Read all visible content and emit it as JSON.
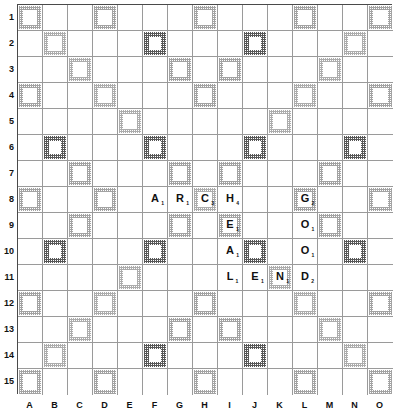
{
  "board": {
    "name": "Scrabble board",
    "size": 15,
    "col_labels": [
      "A",
      "B",
      "C",
      "D",
      "E",
      "F",
      "G",
      "H",
      "I",
      "J",
      "K",
      "L",
      "M",
      "N",
      "O"
    ],
    "row_labels": [
      "1",
      "2",
      "3",
      "4",
      "5",
      "6",
      "7",
      "8",
      "9",
      "10",
      "11",
      "12",
      "13",
      "14",
      "15"
    ],
    "legend": {
      "tw": "triple-word-square",
      "dw": "double-word-square",
      "tl": "triple-letter-square",
      "dl": "double-letter-square",
      "star": "center-star-square"
    },
    "colors": {
      "triple_word": "#8d8d8d",
      "double_word": "#a8a8a8",
      "triple_letter": "#4f4f4f",
      "double_letter": "#9e9e9e",
      "grid_line": "#9a9a9a",
      "border": "#4a4a4a",
      "background": "#ffffff",
      "text": "#111111"
    },
    "premium_squares": {
      "tw": [
        "A1",
        "H1",
        "O1",
        "A8",
        "O8",
        "A15",
        "H15",
        "O15"
      ],
      "dw": [
        "B2",
        "C3",
        "D4",
        "E5",
        "N2",
        "M3",
        "L4",
        "K5",
        "B14",
        "C13",
        "D12",
        "E11",
        "N14",
        "M13",
        "L12",
        "K11"
      ],
      "tl": [
        "F2",
        "J2",
        "B6",
        "F6",
        "J6",
        "N6",
        "B10",
        "F10",
        "J10",
        "N10",
        "F14",
        "J14"
      ],
      "dl": [
        "D1",
        "L1",
        "G3",
        "I3",
        "A4",
        "H4",
        "O4",
        "C7",
        "G7",
        "I7",
        "M7",
        "D8",
        "L8",
        "C9",
        "G9",
        "I9",
        "M9",
        "A12",
        "H12",
        "O12",
        "G13",
        "I13",
        "D15",
        "L15"
      ],
      "star": [
        "H8"
      ]
    },
    "tiles": [
      {
        "square": "F8",
        "letter": "A",
        "value": "1",
        "word_ids": [
          "arch"
        ]
      },
      {
        "square": "G8",
        "letter": "R",
        "value": "1",
        "word_ids": [
          "arch"
        ]
      },
      {
        "square": "H8",
        "letter": "C",
        "value": "3",
        "word_ids": [
          "arch"
        ]
      },
      {
        "square": "I8",
        "letter": "H",
        "value": "4",
        "word_ids": [
          "arch",
          "heal"
        ]
      },
      {
        "square": "I9",
        "letter": "E",
        "value": "1",
        "word_ids": [
          "heal"
        ]
      },
      {
        "square": "I10",
        "letter": "A",
        "value": "1",
        "word_ids": [
          "heal"
        ]
      },
      {
        "square": "I11",
        "letter": "L",
        "value": "1",
        "word_ids": [
          "heal",
          "lend"
        ]
      },
      {
        "square": "J11",
        "letter": "E",
        "value": "1",
        "word_ids": [
          "lend"
        ]
      },
      {
        "square": "K11",
        "letter": "N",
        "value": "1",
        "word_ids": [
          "lend"
        ]
      },
      {
        "square": "L11",
        "letter": "D",
        "value": "2",
        "word_ids": [
          "lend",
          "good"
        ]
      },
      {
        "square": "L10",
        "letter": "O",
        "value": "1",
        "word_ids": [
          "good"
        ]
      },
      {
        "square": "L9",
        "letter": "O",
        "value": "1",
        "word_ids": [
          "good"
        ]
      },
      {
        "square": "L8",
        "letter": "G",
        "value": "2",
        "word_ids": [
          "good"
        ]
      }
    ],
    "words_on_board": [
      {
        "id": "arch",
        "text": "ARCH",
        "direction": "across",
        "start": "F8"
      },
      {
        "id": "heal",
        "text": "HEAL",
        "direction": "down",
        "start": "I8"
      },
      {
        "id": "lend",
        "text": "LEND",
        "direction": "across",
        "start": "I11"
      },
      {
        "id": "good",
        "text": "GOOD",
        "direction": "down",
        "start": "L8"
      }
    ]
  }
}
